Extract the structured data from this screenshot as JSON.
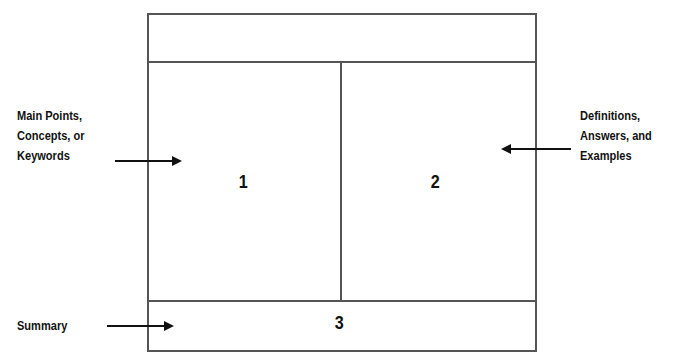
{
  "diagram": {
    "sections": [
      {
        "id": "1",
        "label": "1"
      },
      {
        "id": "2",
        "label": "2"
      },
      {
        "id": "3",
        "label": "3"
      }
    ],
    "annotations": {
      "left": "Main Points,\nConcepts, or\nKeywords",
      "left_lines": [
        "Main Points,",
        "Concepts, or",
        "Keywords"
      ],
      "right_lines": [
        "Definitions,",
        "Answers, and",
        "Examples"
      ],
      "bottom": "Summary"
    },
    "colors": {
      "border": "#555555",
      "text": "#111111"
    }
  }
}
